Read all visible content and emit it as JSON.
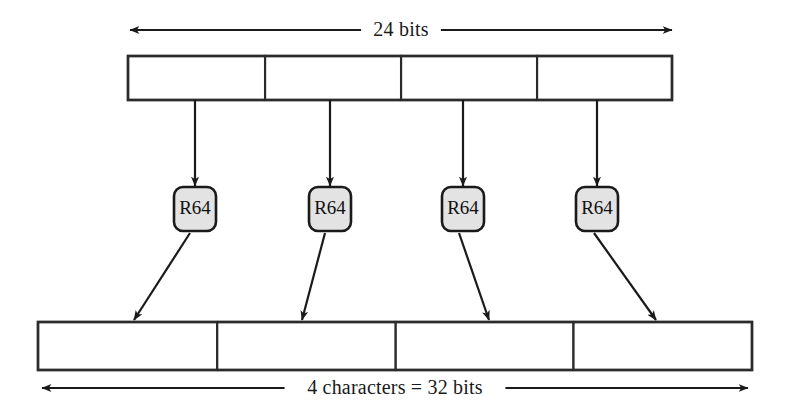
{
  "diagram": {
    "top_measure": {
      "label": "24 bits",
      "x1": 130,
      "x2": 672,
      "y": 30
    },
    "bottom_measure": {
      "label": "4 characters = 32 bits",
      "x1": 42,
      "x2": 748,
      "y": 388
    },
    "top_bar": {
      "name": "input-bits-bar",
      "x": 128,
      "y": 56,
      "width": 544,
      "height": 44,
      "cells": [
        {
          "label": "",
          "width_fraction": 0.252
        },
        {
          "label": "",
          "width_fraction": 0.25
        },
        {
          "label": "",
          "width_fraction": 0.25
        },
        {
          "label": "",
          "width_fraction": 0.248
        }
      ]
    },
    "bottom_bar": {
      "name": "output-characters-bar",
      "x": 38,
      "y": 322,
      "width": 714,
      "height": 48,
      "cells": [
        {
          "label": "",
          "width_fraction": 0.251
        },
        {
          "label": "",
          "width_fraction": 0.25
        },
        {
          "label": "",
          "width_fraction": 0.249
        },
        {
          "label": "",
          "width_fraction": 0.25
        }
      ]
    },
    "encoders": [
      {
        "label": "R64",
        "cx": 195,
        "cy": 209,
        "w": 42,
        "h": 44
      },
      {
        "label": "R64",
        "cx": 330,
        "cy": 209,
        "w": 42,
        "h": 44
      },
      {
        "label": "R64",
        "cx": 463,
        "cy": 209,
        "w": 42,
        "h": 44
      },
      {
        "label": "R64",
        "cx": 597,
        "cy": 209,
        "w": 42,
        "h": 44
      }
    ],
    "input_arrows": [
      {
        "x1": 195,
        "y1": 100,
        "x2": 195,
        "y2": 186
      },
      {
        "x1": 330,
        "y1": 100,
        "x2": 330,
        "y2": 186
      },
      {
        "x1": 463,
        "y1": 100,
        "x2": 463,
        "y2": 186
      },
      {
        "x1": 597,
        "y1": 100,
        "x2": 597,
        "y2": 186
      }
    ],
    "output_arrows": [
      {
        "x1": 190,
        "y1": 233,
        "x2": 134,
        "y2": 320
      },
      {
        "x1": 325,
        "y1": 233,
        "x2": 302,
        "y2": 320
      },
      {
        "x1": 459,
        "y1": 233,
        "x2": 489,
        "y2": 320
      },
      {
        "x1": 594,
        "y1": 233,
        "x2": 656,
        "y2": 320
      }
    ],
    "colors": {
      "stroke": "#1a1a1a",
      "cell_stroke": "#2b2b2b",
      "encoder_fill": "#e3e3e3",
      "background": "#ffffff",
      "text": "#111111"
    }
  }
}
